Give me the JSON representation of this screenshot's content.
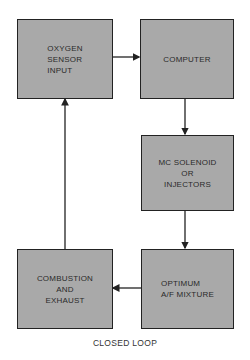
{
  "diagram": {
    "caption": "CLOSED LOOP",
    "colors": {
      "box_fill": "#a9a9a9",
      "border": "#222222",
      "arrow": "#222222",
      "background": "#ffffff"
    },
    "nodes": [
      {
        "id": "oxygen",
        "label": "OXYGEN\nSENSOR\nINPUT"
      },
      {
        "id": "computer",
        "label": "COMPUTER"
      },
      {
        "id": "mc",
        "label": "MC SOLENOID\nOR\nINJECTORS"
      },
      {
        "id": "optimum",
        "label": "OPTIMUM\nA/F MIXTURE"
      },
      {
        "id": "combustion",
        "label": "COMBUSTION\nAND\nEXHAUST"
      }
    ],
    "edges": [
      {
        "from": "oxygen",
        "to": "computer"
      },
      {
        "from": "computer",
        "to": "mc"
      },
      {
        "from": "mc",
        "to": "optimum"
      },
      {
        "from": "optimum",
        "to": "combustion"
      },
      {
        "from": "combustion",
        "to": "oxygen"
      }
    ]
  }
}
